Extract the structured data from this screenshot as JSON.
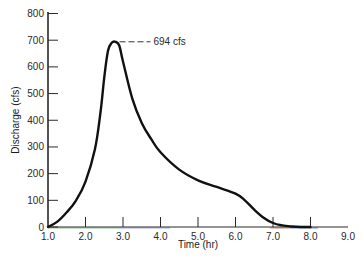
{
  "chart_data": {
    "type": "line",
    "title": "",
    "xlabel": "Time (hr)",
    "ylabel": "Discharge (cfs)",
    "xlim": [
      1.0,
      9.0
    ],
    "ylim": [
      0,
      800
    ],
    "x_ticks": [
      "1.0",
      "2.0",
      "3.0",
      "4.0",
      "5.0",
      "6.0",
      "7.0",
      "8.0",
      "9.0"
    ],
    "y_ticks": [
      "0",
      "100",
      "200",
      "300",
      "400",
      "500",
      "600",
      "700",
      "800"
    ],
    "grid": false,
    "legend": null,
    "series": [
      {
        "name": "Hydrograph",
        "x": [
          1.0,
          1.25,
          1.5,
          1.75,
          2.0,
          2.25,
          2.4,
          2.5,
          2.6,
          2.7,
          2.8,
          2.9,
          3.0,
          3.25,
          3.5,
          3.75,
          4.0,
          4.5,
          5.0,
          5.5,
          6.0,
          6.25,
          6.5,
          6.75,
          7.0,
          7.25,
          7.5,
          7.75,
          8.0
        ],
        "y": [
          0,
          20,
          55,
          100,
          170,
          290,
          430,
          560,
          660,
          690,
          694,
          680,
          620,
          480,
          390,
          330,
          280,
          215,
          175,
          150,
          125,
          100,
          65,
          35,
          15,
          6,
          2,
          0,
          0
        ]
      }
    ],
    "annotations": [
      {
        "text": "694 cfs",
        "x": 2.8,
        "y": 694,
        "style": "dashed leader line to peak"
      }
    ]
  }
}
